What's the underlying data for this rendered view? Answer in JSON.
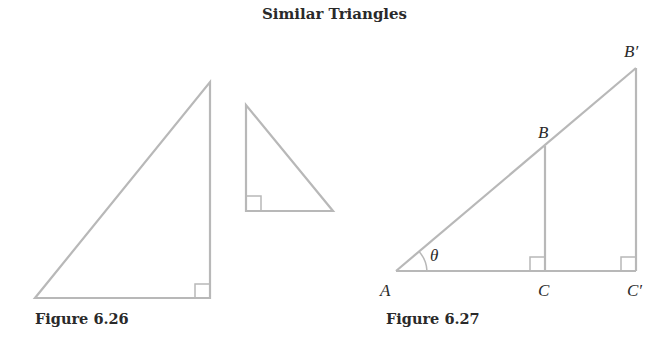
{
  "title": "Similar Triangles",
  "figures": [
    {
      "caption": "Figure 6.26",
      "shapes": [
        {
          "name": "large-right-triangle",
          "vertices": [
            [
              35,
              298
            ],
            [
              210,
              298
            ],
            [
              210,
              82
            ]
          ],
          "right_angle_at": [
            210,
            298
          ]
        },
        {
          "name": "small-right-triangle",
          "vertices": [
            [
              246,
              105
            ],
            [
              246,
              211
            ],
            [
              333,
              211
            ]
          ],
          "right_angle_at": [
            246,
            211
          ]
        }
      ]
    },
    {
      "caption": "Figure 6.27",
      "points": {
        "A": {
          "label": "A",
          "x": 396,
          "y": 271
        },
        "B": {
          "label": "B",
          "x": 545,
          "y": 146
        },
        "C": {
          "label": "C",
          "x": 545,
          "y": 271
        },
        "B_prime": {
          "label": "B′",
          "x": 636,
          "y": 68
        },
        "C_prime": {
          "label": "C′",
          "x": 636,
          "y": 271
        }
      },
      "angle_label": "θ"
    }
  ],
  "colors": {
    "line": "#b8b8b8",
    "text": "#2a2a2a"
  }
}
